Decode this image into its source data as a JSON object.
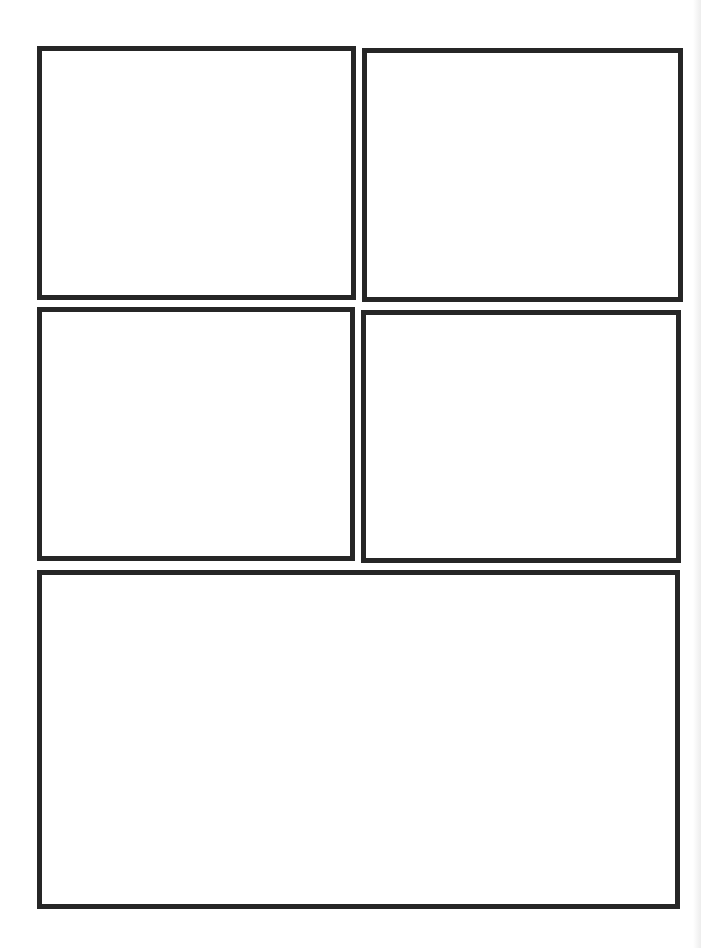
{
  "page": {
    "type": "comic-page-template",
    "background_color": "#ffffff",
    "border_color": "#262626",
    "border_width_px": 5,
    "panel_count": 5
  },
  "panels": [
    {
      "id": "panel-1",
      "row": 1,
      "position": "top-left",
      "x": 37,
      "y": 46,
      "w": 319,
      "h": 254,
      "content": ""
    },
    {
      "id": "panel-2",
      "row": 1,
      "position": "top-right",
      "x": 362,
      "y": 48,
      "w": 321,
      "h": 254,
      "content": ""
    },
    {
      "id": "panel-3",
      "row": 2,
      "position": "middle-left",
      "x": 37,
      "y": 307,
      "w": 318,
      "h": 254,
      "content": ""
    },
    {
      "id": "panel-4",
      "row": 2,
      "position": "middle-right",
      "x": 361,
      "y": 310,
      "w": 320,
      "h": 253,
      "content": ""
    },
    {
      "id": "panel-5",
      "row": 3,
      "position": "bottom-wide",
      "x": 37,
      "y": 570,
      "w": 643,
      "h": 339,
      "content": ""
    }
  ]
}
